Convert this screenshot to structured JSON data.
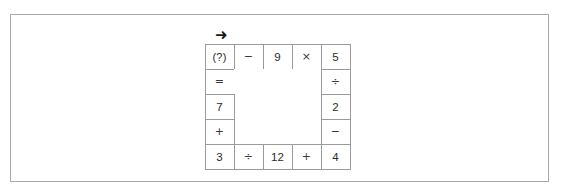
{
  "figure": {
    "direction_marker": "➜",
    "direction_marker_name": "rightward-arrow"
  },
  "puzzle": {
    "type": "ring-equation-grid",
    "rows": 5,
    "columns": 5,
    "cells": {
      "r0c0": "(?)",
      "r0c1": "−",
      "r0c2": "9",
      "r0c3": "×",
      "r0c4": "5",
      "r1c0": "=",
      "r1c4": "÷",
      "r2c0": "7",
      "r2c4": "2",
      "r3c0": "+",
      "r3c4": "−",
      "r4c0": "3",
      "r4c1": "÷",
      "r4c2": "12",
      "r4c3": "+",
      "r4c4": "4"
    }
  }
}
